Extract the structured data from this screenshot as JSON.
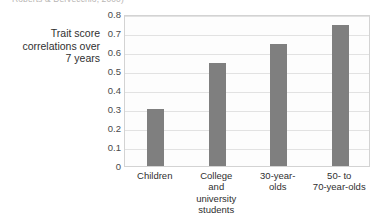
{
  "citation": "Roberts & DelVecchio, 2000)",
  "chart_data": {
    "type": "bar",
    "title": "",
    "xlabel": "",
    "ylabel": "Trait score\ncorrelations over\n7 years",
    "categories": [
      "Children",
      "College\nand\nuniversity\nstudents",
      "30-year-\nolds",
      "50- to\n70-year-olds"
    ],
    "values": [
      0.3,
      0.54,
      0.64,
      0.74
    ],
    "ylim": [
      0,
      0.8
    ],
    "ytick_labels": [
      "0.8",
      "0.7",
      "0.6",
      "0.5",
      "0.4",
      "0.3",
      "0.2",
      "0.1",
      "0"
    ],
    "ytick_values": [
      0.8,
      0.7,
      0.6,
      0.5,
      0.4,
      0.3,
      0.2,
      0.1,
      0
    ],
    "grid": true,
    "legend": false,
    "bar_color": "#7f7f7f",
    "gridline_color": "#e2e2e2",
    "plot_background": "#fdfdfd",
    "plot_border_color": "#d3d3d3"
  }
}
